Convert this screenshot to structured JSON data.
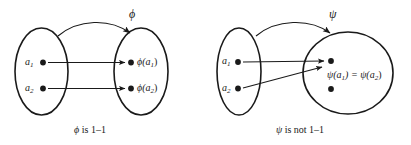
{
  "figure": {
    "background_color": "#ffffff",
    "stroke_color": "#1a1a1a",
    "panels": [
      {
        "id": "phi-panel",
        "map_label": "ϕ",
        "caption_symbol": "ϕ",
        "caption_text": " is 1–1",
        "caption_full": "ϕ is 1–1",
        "domain": {
          "name": "domain-set",
          "elements": [
            {
              "label": "a",
              "sub": "1",
              "full": "a₁"
            },
            {
              "label": "a",
              "sub": "2",
              "full": "a₂"
            }
          ]
        },
        "codomain": {
          "name": "codomain-set",
          "elements": [
            {
              "label": "ϕ(a",
              "sub": "1",
              "tail": ")",
              "full": "ϕ(a₁)"
            },
            {
              "label": "ϕ(a",
              "sub": "2",
              "tail": ")",
              "full": "ϕ(a₂)"
            }
          ]
        }
      },
      {
        "id": "psi-panel",
        "map_label": "ψ",
        "caption_symbol": "ψ",
        "caption_text": " is not 1–1",
        "caption_full": "ψ is not 1–1",
        "domain": {
          "name": "domain-set",
          "elements": [
            {
              "label": "a",
              "sub": "1",
              "full": "a₁"
            },
            {
              "label": "a",
              "sub": "2",
              "full": "a₂"
            }
          ]
        },
        "codomain": {
          "name": "codomain-set",
          "shared_image_label": {
            "left": "ψ(a",
            "left_sub": "1",
            "mid": ") = ψ(a",
            "right_sub": "2",
            "tail": ")",
            "full": "ψ(a₁) = ψ(a₂)"
          }
        }
      }
    ]
  }
}
